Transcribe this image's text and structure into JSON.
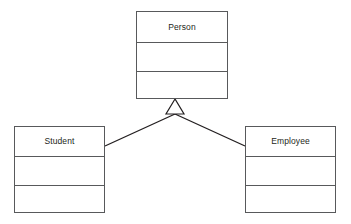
{
  "diagram": {
    "kind": "uml-class-diagram",
    "width": 351,
    "height": 224,
    "background_color": "#ffffff",
    "stroke_color": "#58595b",
    "line_color": "#231f20",
    "text_color": "#231f20"
  },
  "classes": [
    {
      "id": "person",
      "name": "Person",
      "role": "superclass",
      "x": 136,
      "y": 11,
      "width": 92,
      "height": 88,
      "compartments": [
        {
          "type": "name",
          "height": 31,
          "text": "Person"
        },
        {
          "type": "attributes",
          "height": 29,
          "text": ""
        },
        {
          "type": "operations",
          "height": 28,
          "text": ""
        }
      ]
    },
    {
      "id": "student",
      "name": "Student",
      "role": "subclass",
      "x": 14,
      "y": 126,
      "width": 91,
      "height": 87,
      "compartments": [
        {
          "type": "name",
          "height": 30,
          "text": "Student"
        },
        {
          "type": "attributes",
          "height": 29,
          "text": ""
        },
        {
          "type": "operations",
          "height": 28,
          "text": ""
        }
      ]
    },
    {
      "id": "employee",
      "name": "Employee",
      "role": "subclass",
      "x": 245,
      "y": 126,
      "width": 91,
      "height": 87,
      "compartments": [
        {
          "type": "name",
          "height": 30,
          "text": "Employee"
        },
        {
          "type": "attributes",
          "height": 29,
          "text": ""
        },
        {
          "type": "operations",
          "height": 28,
          "text": ""
        }
      ]
    }
  ],
  "relationships": [
    {
      "id": "student-inherits-person",
      "type": "generalization",
      "source": "student",
      "target": "person",
      "label": "",
      "path": "M 105 146 L 175 114"
    },
    {
      "id": "employee-inherits-person",
      "type": "generalization",
      "source": "employee",
      "target": "person",
      "label": "",
      "path": "M 245 146 L 175 114"
    }
  ],
  "generalization_arrowhead": {
    "shape": "hollow-triangle",
    "apex_x": 175,
    "apex_y": 99,
    "base_left_x": 166,
    "base_right_x": 184,
    "base_y": 114,
    "fill": "#ffffff",
    "stroke": "#231f20",
    "points": "175,99 166,114 184,114"
  }
}
